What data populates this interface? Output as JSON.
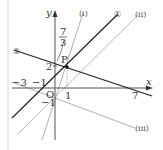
{
  "diagram": {
    "axes": {
      "x_label": "x",
      "y_label": "y",
      "origin_label": "O"
    },
    "tick_labels": {
      "x_neg3": "−3",
      "x_neg1": "−1",
      "x_1": "1",
      "x_7": "7",
      "y_2": "2",
      "y_neg1": "−1",
      "y_frac_num": "7",
      "y_frac_den": "3"
    },
    "point": {
      "label": "P",
      "coords": "(1, 2)"
    },
    "lines": [
      {
        "id": "line-1",
        "label": "①",
        "color": "#222222"
      },
      {
        "id": "line-2",
        "label": "②",
        "color": "#222222"
      },
      {
        "id": "line-i",
        "label": "(i)",
        "color": "#aaaaaa"
      },
      {
        "id": "line-ii",
        "label": "(ii)",
        "color": "#aaaaaa"
      },
      {
        "id": "line-iii",
        "label": "(iii)",
        "color": "#aaaaaa"
      }
    ],
    "colors": {
      "axis": "#333333",
      "dark_line": "#222222",
      "light_line": "#aaaaaa",
      "border": "#cccccc"
    }
  }
}
